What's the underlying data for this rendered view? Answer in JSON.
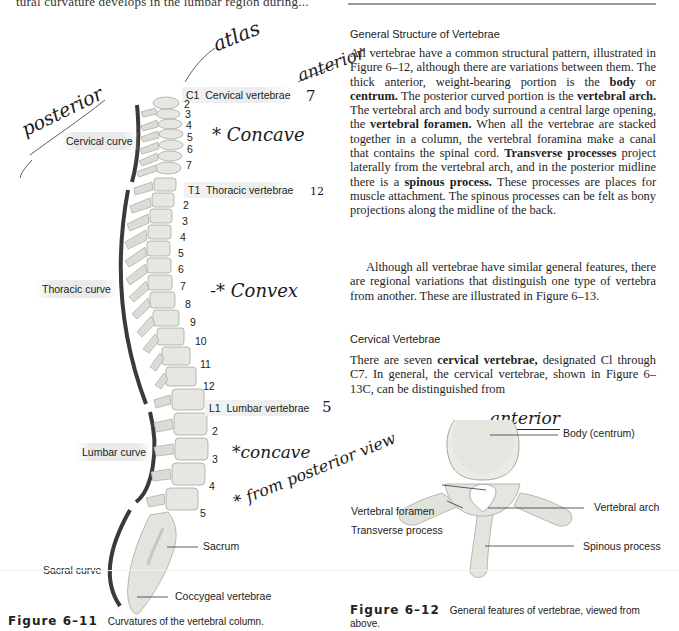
{
  "page": {
    "top_cutoff_text": "tural curvature develops in the lumbar region during...",
    "header_rule": true
  },
  "figure_6_11": {
    "caption_label": "Figure 6–11",
    "caption_text": "Curvatures of the vertebral column.",
    "curve_labels": [
      "Cervical curve",
      "Thoracic curve",
      "Lumbar curve",
      "Sacral curve"
    ],
    "region_labels": {
      "cervical": {
        "start": "C1",
        "name": "Cervical vertebrae"
      },
      "thoracic": {
        "start": "T1",
        "name": "Thoracic vertebrae"
      },
      "lumbar": {
        "start": "L1",
        "name": "Lumbar vertebrae"
      },
      "sacrum": "Sacrum",
      "coccyx": "Coccygeal vertebrae"
    },
    "cervical_numbers": [
      "2",
      "3",
      "4",
      "5",
      "6",
      "7"
    ],
    "thoracic_numbers": [
      "2",
      "3",
      "4",
      "5",
      "6",
      "7",
      "8",
      "9",
      "10",
      "11",
      "12"
    ],
    "lumbar_numbers": [
      "2",
      "3",
      "4",
      "5"
    ]
  },
  "handwritten_notes": {
    "atlas": "atlas",
    "anterior_top": "anterior",
    "posterior": "posterior",
    "cervical_count": "7",
    "thoracic_count": "12",
    "lumbar_count": "5",
    "cervical_note": "* Concave",
    "thoracic_note": "-* Convex",
    "lumbar_note": "*concave",
    "view_note": "* from posterior view",
    "anterior_fig": "anterior"
  },
  "right_column": {
    "section1_heading": "General Structure of Vertebrae",
    "p1": [
      {
        "t": "All vertebrae have a common structural pattern, illustrated in Figure 6–12, although there are variations between them. The thick anterior, weight-bearing portion is the "
      },
      {
        "b": "body"
      },
      {
        "t": " or "
      },
      {
        "b": "centrum."
      },
      {
        "t": " The posterior curved portion is the "
      },
      {
        "b": "vertebral arch."
      },
      {
        "t": " The vertebral arch and body surround a central large opening, the "
      },
      {
        "b": "vertebral foramen."
      },
      {
        "t": " When all the vertebrae are stacked together in a column, the vertebral foramina make a canal that contains the spinal cord. "
      },
      {
        "b": "Transverse processes"
      },
      {
        "t": " project laterally from the vertebral arch, and in the posterior midline there is a "
      },
      {
        "b": "spinous process."
      },
      {
        "t": " These processes are places for muscle attachment. The spinous processes can be felt as bony projections along the midline of the back."
      }
    ],
    "p2": "Although all vertebrae have similar general features, there are regional variations that distinguish one type of vertebra from another. These are illustrated in Figure 6–13.",
    "section2_heading": "Cervical Vertebrae",
    "p3": [
      {
        "t": "There are seven "
      },
      {
        "b": "cervical vertebrae,"
      },
      {
        "t": " designated Cl through C7. In general, the cervical vertebrae, shown in Figure 6–13C, can be distinguished from"
      }
    ]
  },
  "figure_6_12": {
    "caption_label": "Figure 6–12",
    "caption_text": "General features of vertebrae, viewed from above.",
    "labels": {
      "body": "Body (centrum)",
      "foramen": "Vertebral foramen",
      "transverse": "Transverse process",
      "arch": "Vertebral arch",
      "spinous": "Spinous process"
    }
  },
  "colors": {
    "curve_bar": "#3a3a3a",
    "bone": "#e6e6e2",
    "bone_shadow": "#b9b9b3",
    "ink": "#1a1a1a"
  }
}
